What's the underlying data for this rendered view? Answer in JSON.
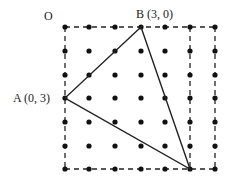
{
  "labels": {
    "origin": "O",
    "point_a": "A (0, 3)",
    "point_b": "B (3, 0)"
  },
  "grid": {
    "columns_x": [
      65,
      89,
      115,
      141,
      165,
      190,
      215
    ],
    "rows_y": [
      27,
      51,
      75,
      98,
      122,
      146,
      169
    ],
    "dot_color": "#111111"
  },
  "triangle": {
    "vertices": [
      [
        141,
        27
      ],
      [
        65,
        98
      ],
      [
        190,
        169
      ]
    ],
    "stroke": "#222222"
  },
  "dashed_lines": [
    [
      65,
      27,
      215,
      27
    ],
    [
      65,
      27,
      65,
      169
    ],
    [
      65,
      169,
      215,
      169
    ],
    [
      190,
      27,
      190,
      169
    ],
    [
      215,
      27,
      215,
      169
    ]
  ]
}
